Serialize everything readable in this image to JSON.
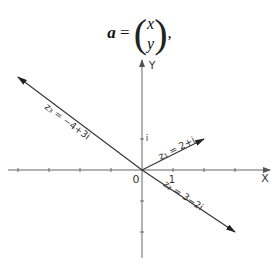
{
  "equation": {
    "lhs": "a",
    "equals": "=",
    "vector_top": "x",
    "vector_bottom": "y",
    "trailing": ","
  },
  "chart_data": {
    "type": "vector-diagram",
    "title": "",
    "axes": {
      "x_label": "X",
      "y_label": "Y",
      "origin_label": "0",
      "x_unit_label": "1",
      "y_unit_label": "i",
      "x_range": [
        -4.3,
        4.2
      ],
      "y_range": [
        -2.8,
        3.5
      ],
      "x_ticks": [
        -4,
        -3,
        -2,
        -1,
        1,
        2,
        3
      ],
      "y_ticks": [
        -2,
        -1,
        1
      ]
    },
    "vectors": [
      {
        "name": "z1",
        "label": "z₁ = 2+i",
        "re": 2,
        "im": 1
      },
      {
        "name": "z2",
        "label": "z₂ = 3−2i",
        "re": 3,
        "im": -2
      },
      {
        "name": "z3",
        "label": "z₃ = −4+3i",
        "re": -4,
        "im": 3
      }
    ]
  }
}
